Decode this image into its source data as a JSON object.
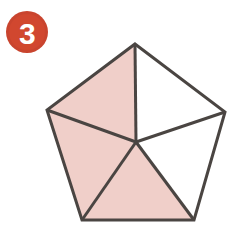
{
  "figure": {
    "label_badge": {
      "icon": "numbered-circle-badge-icon",
      "number": "3",
      "circle_color": "#D1472F",
      "circle_outer_color": "#C9442E",
      "number_color": "#FFFFFF",
      "center_x": 27,
      "center_y": 32,
      "radius": 21
    },
    "background_color": "#FFFFFF",
    "shape": {
      "name": "regular-pentagon",
      "stroke_color": "#4A4542",
      "stroke_width": 3,
      "shaded_fill": "#F0CFC9",
      "unshaded_fill": "#FFFFFF",
      "center": {
        "x": 136,
        "y": 142
      },
      "vertices": [
        {
          "name": "apex",
          "x": 135,
          "y": 44
        },
        {
          "name": "right",
          "x": 225,
          "y": 112
        },
        {
          "name": "bottom-right",
          "x": 194,
          "y": 220
        },
        {
          "name": "bottom-left",
          "x": 82,
          "y": 220
        },
        {
          "name": "left",
          "x": 47,
          "y": 110
        }
      ],
      "sectors": [
        {
          "name": "sector-top-left",
          "points": "135,44 47,110 136,142",
          "shaded": true,
          "fill": "#F0CFC9"
        },
        {
          "name": "sector-top-right",
          "points": "135,44 225,112 136,142",
          "shaded": false,
          "fill": "#FFFFFF"
        },
        {
          "name": "sector-right",
          "points": "225,112 194,220 136,142",
          "shaded": false,
          "fill": "#FFFFFF"
        },
        {
          "name": "sector-bottom",
          "points": "194,220 82,220 136,142",
          "shaded": true,
          "fill": "#F0CFC9"
        },
        {
          "name": "sector-left",
          "points": "82,220 47,110 136,142",
          "shaded": true,
          "fill": "#F0CFC9"
        }
      ],
      "spokes": [
        {
          "name": "spoke-to-apex",
          "x1": 136,
          "y1": 142,
          "x2": 135,
          "y2": 44
        },
        {
          "name": "spoke-to-right",
          "x1": 136,
          "y1": 142,
          "x2": 225,
          "y2": 112
        },
        {
          "name": "spoke-to-bottom-right",
          "x1": 136,
          "y1": 142,
          "x2": 194,
          "y2": 220
        },
        {
          "name": "spoke-to-bottom-left",
          "x1": 136,
          "y1": 142,
          "x2": 82,
          "y2": 220
        },
        {
          "name": "spoke-to-left",
          "x1": 136,
          "y1": 142,
          "x2": 47,
          "y2": 110
        }
      ],
      "outline_points": "135,44 225,112 194,220 82,220 47,110"
    }
  }
}
